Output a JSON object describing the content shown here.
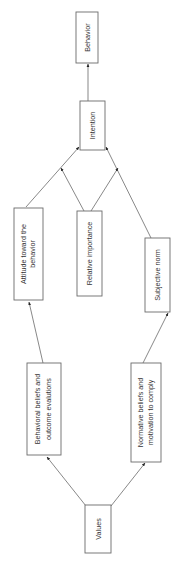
{
  "diagram": {
    "orientation": "rotated -90deg (text reads bottom-to-top)",
    "nodes": [
      {
        "id": "behavior",
        "lines": [
          "Behavior"
        ]
      },
      {
        "id": "intention",
        "lines": [
          "Intention"
        ]
      },
      {
        "id": "attitude",
        "lines": [
          "Attitude toward the",
          "behavior"
        ]
      },
      {
        "id": "relative_importance",
        "lines": [
          "Relative importance"
        ]
      },
      {
        "id": "subjective_norm",
        "lines": [
          "Subjective norm"
        ]
      },
      {
        "id": "behavioral_beliefs",
        "lines": [
          "Behavioral beliefs and",
          "outcome evalutions"
        ]
      },
      {
        "id": "normative_beliefs",
        "lines": [
          "Normative beliefs and",
          "motivation to comply"
        ]
      },
      {
        "id": "values",
        "lines": [
          "Values"
        ]
      }
    ],
    "edges": [
      {
        "from": "intention",
        "to": "behavior"
      },
      {
        "from": "attitude",
        "to": "intention"
      },
      {
        "from": "subjective_norm",
        "to": "intention"
      },
      {
        "from": "relative_importance",
        "to": "attitude->intention"
      },
      {
        "from": "relative_importance",
        "to": "subjective_norm->intention"
      },
      {
        "from": "behavioral_beliefs",
        "to": "attitude"
      },
      {
        "from": "normative_beliefs",
        "to": "subjective_norm"
      },
      {
        "from": "values",
        "to": "behavioral_beliefs"
      },
      {
        "from": "values",
        "to": "normative_beliefs"
      }
    ]
  }
}
